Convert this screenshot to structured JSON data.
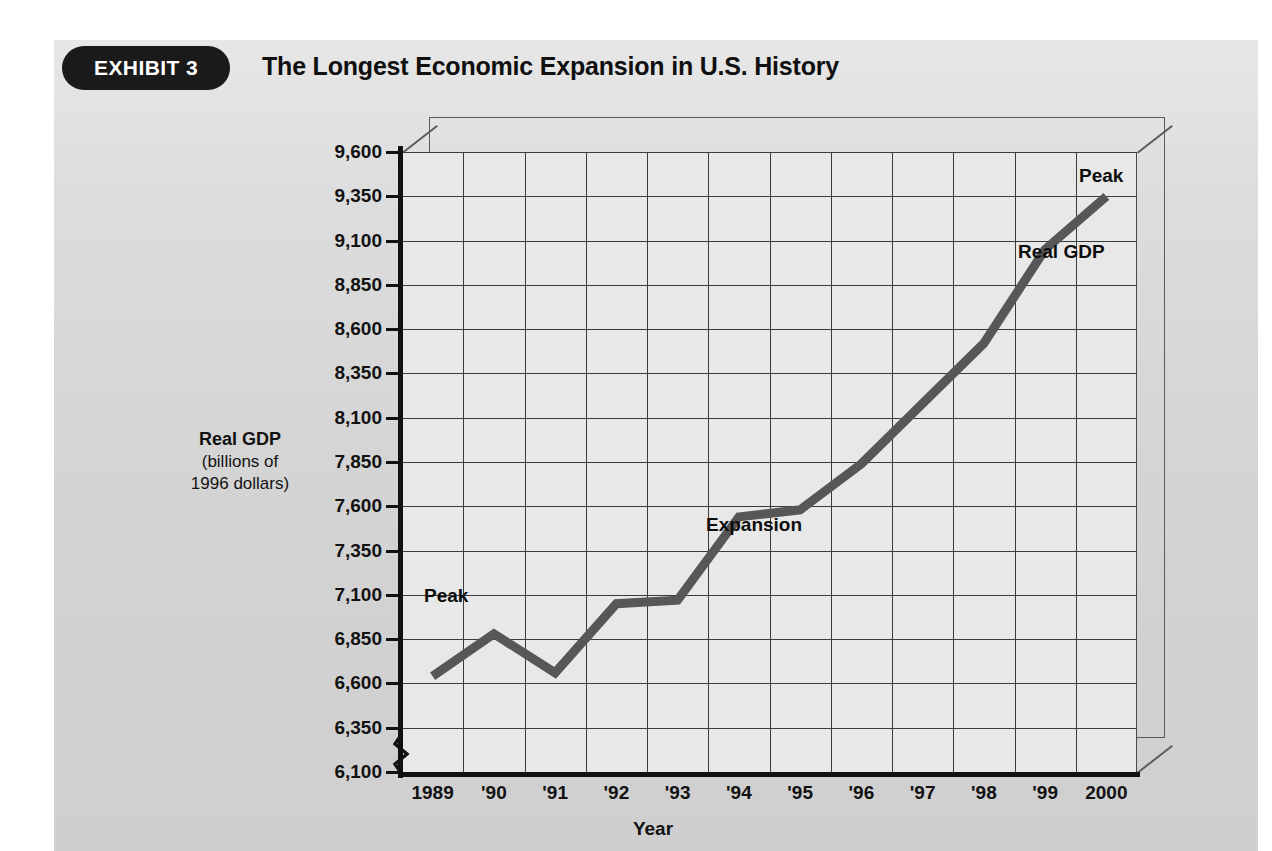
{
  "exhibit": {
    "badge_label": "EXHIBIT 3",
    "title": "The Longest Economic Expansion in U.S. History"
  },
  "axis_titles": {
    "y_line1": "Real GDP",
    "y_line2": "(billions of",
    "y_line3": "1996 dollars)",
    "x": "Year"
  },
  "annotations": {
    "peak_left": "Peak",
    "expansion": "Expansion",
    "peak_right": "Peak",
    "series_label": "Real GDP"
  },
  "colors": {
    "line": "#575757",
    "plot_background": "#e8e8e8",
    "grid": "#3a3a3a",
    "axis": "#111111",
    "badge": "#1a1a1a",
    "badge_text": "#ffffff"
  },
  "chart_data": {
    "type": "line",
    "title": "The Longest Economic Expansion in U.S. History",
    "xlabel": "Year",
    "ylabel": "Real GDP (billions of 1996 dollars)",
    "x": [
      1989,
      1990,
      1991,
      1992,
      1993,
      1994,
      1995,
      1996,
      1997,
      1998,
      1999,
      2000
    ],
    "categories": [
      "1989",
      "'90",
      "'91",
      "'92",
      "'93",
      "'94",
      "'95",
      "'96",
      "'97",
      "'98",
      "'99",
      "2000"
    ],
    "series": [
      {
        "name": "Real GDP",
        "values": [
          6640,
          6880,
          6660,
          7050,
          7070,
          7540,
          7580,
          7840,
          8180,
          8520,
          9050,
          9350
        ]
      }
    ],
    "ylim": [
      6100,
      9600
    ],
    "ytick_step": 250,
    "yticks": [
      6100,
      6350,
      6600,
      6850,
      7100,
      7350,
      7600,
      7850,
      8100,
      8350,
      8600,
      8850,
      9100,
      9350,
      9600
    ],
    "ytick_labels": [
      "6,100",
      "6,350",
      "6,600",
      "6,850",
      "7,100",
      "7,350",
      "7,600",
      "7,850",
      "8,100",
      "8,350",
      "8,600",
      "8,850",
      "9,100",
      "9,350",
      "9,600"
    ],
    "y_axis_break": true,
    "grid": true,
    "legend": "none",
    "annotations": [
      {
        "text": "Peak",
        "x": 1990,
        "y": 6880
      },
      {
        "text": "Expansion",
        "x": 1995,
        "y": 7350
      },
      {
        "text": "Peak",
        "x": 2000,
        "y": 9350
      },
      {
        "text": "Real GDP",
        "x": 1999,
        "y": 9100
      }
    ]
  }
}
